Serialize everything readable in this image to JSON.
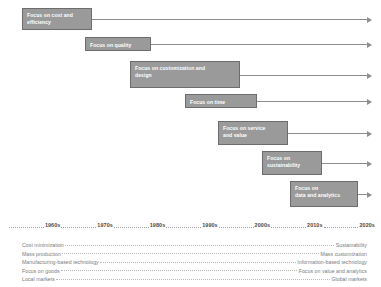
{
  "diagram": {
    "colors": {
      "box_fill": "#9a9a9a",
      "box_border": "#6d6d6d",
      "box_text": "#ffffff",
      "arrow": "#8e8e8e",
      "axis_text": "#4a4a4a",
      "attribute_text": "#7b7b7b",
      "dotted_leader": "#b9b9b9",
      "background": "#ffffff"
    }
  },
  "phases": [
    {
      "label": "Focus on cost and\nefficiency",
      "x": 22,
      "y": 8,
      "width": 70,
      "height": 22
    },
    {
      "label": "Focus on quality",
      "x": 85,
      "y": 37,
      "width": 66,
      "height": 14
    },
    {
      "label": "Focus on customization and\ndesign",
      "x": 130,
      "y": 61,
      "width": 110,
      "height": 27
    },
    {
      "label": "Focus on time",
      "x": 185,
      "y": 94,
      "width": 72,
      "height": 14
    },
    {
      "label": "Focus on service\nand value",
      "x": 218,
      "y": 121,
      "width": 70,
      "height": 24
    },
    {
      "label": "Focus on\nsustainability",
      "x": 262,
      "y": 151,
      "width": 60,
      "height": 24
    },
    {
      "label": "Focus on\ndata and analytics",
      "x": 290,
      "y": 181,
      "width": 68,
      "height": 26
    }
  ],
  "arrow_end_x": 372,
  "decades": [
    "1960s",
    "1970s",
    "1980s",
    "1990s",
    "2000s",
    "2010s",
    "2020s"
  ],
  "attributes": [
    {
      "left": "Cost minimization",
      "right": "Sustainability"
    },
    {
      "left": "Mass production",
      "right": "Mass customization"
    },
    {
      "left": "Manufacturing-based technology",
      "right": "Information-based technology"
    },
    {
      "left": "Focus on goods",
      "right": "Focus on value and analytics"
    },
    {
      "left": "Local markets",
      "right": "Global markets"
    }
  ]
}
